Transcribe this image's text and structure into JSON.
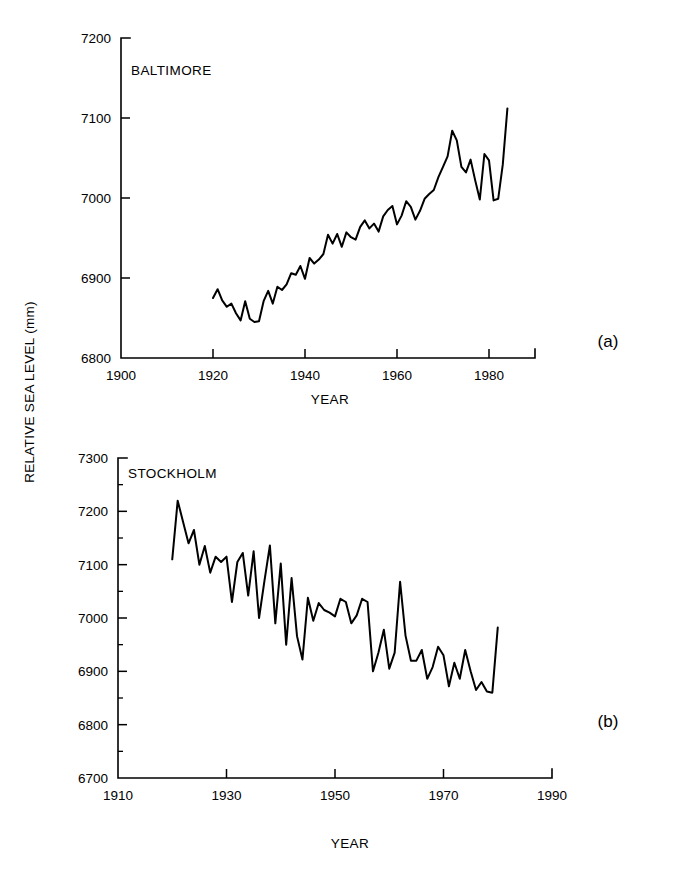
{
  "figure": {
    "shared_ylabel": "RELATIVE SEA LEVEL (mm)",
    "panel_a_tag": "(a)",
    "panel_b_tag": "(b)"
  },
  "chart_data": [
    {
      "type": "line",
      "panel": "(a)",
      "title": "BALTIMORE",
      "xlabel": "YEAR",
      "ylabel": "RELATIVE SEA LEVEL (mm)",
      "xlim": [
        1900,
        1990
      ],
      "ylim": [
        6800,
        7200
      ],
      "xticks": [
        1900,
        1920,
        1940,
        1960,
        1980
      ],
      "yticks": [
        6800,
        6900,
        7000,
        7100,
        7200
      ],
      "grid": false,
      "legend": "none",
      "axis_style": "left-and-bottom-spines",
      "x": [
        1920,
        1921,
        1922,
        1923,
        1924,
        1925,
        1926,
        1927,
        1928,
        1929,
        1930,
        1931,
        1932,
        1933,
        1934,
        1935,
        1936,
        1937,
        1938,
        1939,
        1940,
        1941,
        1942,
        1943,
        1944,
        1945,
        1946,
        1947,
        1948,
        1949,
        1950,
        1951,
        1952,
        1953,
        1954,
        1955,
        1956,
        1957,
        1958,
        1959,
        1960,
        1961,
        1962,
        1963,
        1964,
        1965,
        1966,
        1967,
        1968,
        1969,
        1970,
        1971,
        1972,
        1973,
        1974,
        1975,
        1976,
        1977,
        1978,
        1979,
        1980,
        1981,
        1982,
        1983,
        1984
      ],
      "values": [
        6875,
        6886,
        6872,
        6864,
        6868,
        6856,
        6847,
        6871,
        6849,
        6845,
        6846,
        6871,
        6884,
        6868,
        6889,
        6885,
        6892,
        6906,
        6904,
        6915,
        6899,
        6925,
        6918,
        6923,
        6930,
        6954,
        6943,
        6955,
        6939,
        6957,
        6951,
        6948,
        6964,
        6972,
        6962,
        6968,
        6958,
        6977,
        6985,
        6990,
        6967,
        6978,
        6996,
        6989,
        6973,
        6984,
        6999,
        7005,
        7010,
        7026,
        7039,
        7052,
        7084,
        7072,
        7039,
        7032,
        7048,
        7022,
        6998,
        7055,
        7047,
        6997,
        6999,
        7042,
        7112
      ]
    },
    {
      "type": "line",
      "panel": "(b)",
      "title": "STOCKHOLM",
      "xlabel": "YEAR",
      "ylabel": "RELATIVE SEA LEVEL (mm)",
      "xlim": [
        1910,
        1990
      ],
      "ylim": [
        6700,
        7300
      ],
      "xticks": [
        1910,
        1930,
        1950,
        1970,
        1990
      ],
      "yticks": [
        6700,
        6800,
        6900,
        7000,
        7100,
        7200,
        7300
      ],
      "yticks_minor": [
        6750,
        6850,
        6950,
        7050,
        7150,
        7250
      ],
      "grid": false,
      "legend": "none",
      "axis_style": "left-and-bottom-spines",
      "x": [
        1920,
        1921,
        1922,
        1923,
        1924,
        1925,
        1926,
        1927,
        1928,
        1929,
        1930,
        1931,
        1932,
        1933,
        1934,
        1935,
        1936,
        1937,
        1938,
        1939,
        1940,
        1941,
        1942,
        1943,
        1944,
        1945,
        1946,
        1947,
        1948,
        1949,
        1950,
        1951,
        1952,
        1953,
        1954,
        1955,
        1956,
        1957,
        1958,
        1959,
        1960,
        1961,
        1962,
        1963,
        1964,
        1965,
        1966,
        1967,
        1968,
        1969,
        1970,
        1971,
        1972,
        1973,
        1974,
        1975,
        1976,
        1977,
        1978,
        1979,
        1980
      ],
      "values": [
        7110,
        7220,
        7180,
        7140,
        7165,
        7100,
        7135,
        7085,
        7115,
        7105,
        7115,
        7030,
        7105,
        7122,
        7042,
        7125,
        7000,
        7070,
        7136,
        6990,
        7102,
        6950,
        7075,
        6966,
        6922,
        7038,
        6995,
        7028,
        7015,
        7010,
        7003,
        7036,
        7030,
        6990,
        7005,
        7036,
        7030,
        6900,
        6935,
        6978,
        6905,
        6935,
        7068,
        6967,
        6920,
        6920,
        6940,
        6886,
        6908,
        6946,
        6930,
        6872,
        6916,
        6886,
        6940,
        6900,
        6865,
        6880,
        6862,
        6860,
        6982
      ]
    }
  ]
}
